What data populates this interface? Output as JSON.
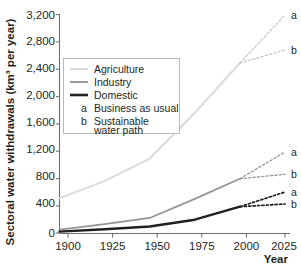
{
  "chart_data": {
    "type": "line",
    "title": "",
    "xlabel": "Year",
    "ylabel": "Sectoral water withdrawals (km³ per year)",
    "xlim": [
      1900,
      2025
    ],
    "ylim": [
      0,
      3200
    ],
    "grid": false,
    "x_ticks": [
      "1900",
      "1925",
      "1950",
      "1975",
      "2000",
      "2025"
    ],
    "x_tick_values": [
      1900,
      1925,
      1950,
      1975,
      2000,
      2025
    ],
    "y_ticks": [
      "0",
      "400",
      "800",
      "1,200",
      "1,600",
      "2,000",
      "2,400",
      "2,800",
      "3,200"
    ],
    "y_tick_values": [
      0,
      400,
      800,
      1200,
      1600,
      2000,
      2400,
      2800,
      3200
    ],
    "x_historical": [
      1900,
      1925,
      1950,
      1975,
      2000
    ],
    "x_projection": [
      2000,
      2025
    ],
    "series": [
      {
        "name": "Agriculture",
        "color": "#d9dadb",
        "width": 2.0,
        "values": [
          510,
          760,
          1090,
          1760,
          2490
        ],
        "scenarios": [
          {
            "code": "a",
            "name": "Business as usual",
            "values": [
              2490,
              3190
            ]
          },
          {
            "code": "b",
            "name": "Sustainable water path",
            "values": [
              2490,
              2680
            ]
          }
        ]
      },
      {
        "name": "Industry",
        "color": "#929497",
        "width": 1.8,
        "values": [
          50,
          130,
          220,
          500,
          795
        ],
        "scenarios": [
          {
            "code": "a",
            "name": "Business as usual",
            "values": [
              795,
              1185
            ]
          },
          {
            "code": "b",
            "name": "Sustainable water path",
            "values": [
              795,
              860
            ]
          }
        ]
      },
      {
        "name": "Domestic",
        "color": "#231f20",
        "width": 2.4,
        "values": [
          20,
          55,
          95,
          195,
          385
        ],
        "scenarios": [
          {
            "code": "a",
            "name": "Business as usual",
            "values": [
              385,
              600
            ]
          },
          {
            "code": "b",
            "name": "Sustainable water path",
            "values": [
              385,
              425
            ]
          }
        ]
      }
    ],
    "legend": {
      "position": "upper-left-inside",
      "entries": [
        {
          "kind": "line",
          "label": "Agriculture",
          "color": "#d9dadb",
          "width": 2.0
        },
        {
          "kind": "line",
          "label": "Industry",
          "color": "#929497",
          "width": 1.8
        },
        {
          "kind": "line",
          "label": "Domestic",
          "color": "#231f20",
          "width": 2.4
        },
        {
          "kind": "code",
          "code": "a",
          "label": "Business as usual"
        },
        {
          "kind": "code",
          "code": "b",
          "label": "Sustainable",
          "label2": "water path"
        }
      ]
    },
    "annotations": [
      {
        "text": "a",
        "series": "Agriculture",
        "value": 3190
      },
      {
        "text": "b",
        "series": "Agriculture",
        "value": 2680
      },
      {
        "text": "a",
        "series": "Industry",
        "value": 1185
      },
      {
        "text": "b",
        "series": "Industry",
        "value": 860
      },
      {
        "text": "a",
        "series": "Domestic",
        "value": 600
      },
      {
        "text": "b",
        "series": "Domestic",
        "value": 425
      }
    ]
  },
  "labels": {
    "y_axis_title": "Sectoral water withdrawals (km³ per year)",
    "x_axis_title": "Year",
    "y0": "0",
    "y1": "400",
    "y2": "800",
    "y3": "1,200",
    "y4": "1,600",
    "y5": "2,000",
    "y6": "2,400",
    "y7": "2,800",
    "y8": "3,200",
    "x0": "1900",
    "x1": "1925",
    "x2": "1950",
    "x3": "1975",
    "x4": "2000",
    "x5": "2025",
    "legend_agriculture": "Agriculture",
    "legend_industry": "Industry",
    "legend_domestic": "Domestic",
    "legend_code_a": "a",
    "legend_code_b": "b",
    "legend_bau": "Business as usual",
    "legend_sustainable_1": "Sustainable",
    "legend_sustainable_2": "water path",
    "ann_agri_a": "a",
    "ann_agri_b": "b",
    "ann_ind_a": "a",
    "ann_ind_b": "b",
    "ann_dom_a": "a",
    "ann_dom_b": "b"
  }
}
